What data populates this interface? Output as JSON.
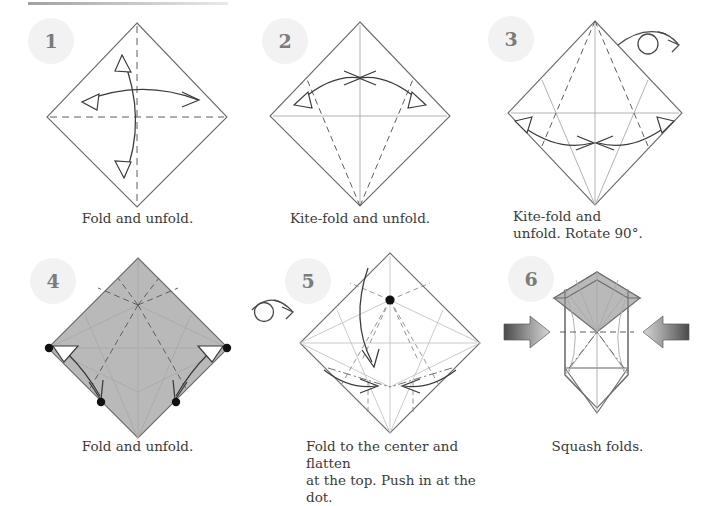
{
  "document": {
    "title": "Origami diagram sequence",
    "page_width": 703,
    "page_height": 494,
    "background_color": "#ffffff",
    "paper_front_color": "#b9b9b9",
    "paper_back_color": "#ffffff",
    "line_color": "#6d6d6d",
    "badge_color": "#f2f2f2",
    "badge_text_color": "#7b7b7b",
    "caption_color": "#3b3b3b"
  },
  "steps": [
    {
      "number": "1",
      "caption": "Fold and unfold.",
      "caption_align": "center",
      "shape": "diamond",
      "side_up": "white",
      "creases": [
        "horizontal-center-valley",
        "vertical-center-valley"
      ],
      "arrows": [
        "horizontal-double-headed",
        "vertical-double-headed"
      ],
      "rotate_symbol": false,
      "flip_symbol": false
    },
    {
      "number": "2",
      "caption": "Kite-fold and unfold.",
      "caption_align": "center",
      "shape": "diamond",
      "side_up": "white",
      "creases": [
        "horizontal-center",
        "vertical-center",
        "kite-left-valley",
        "kite-right-valley"
      ],
      "arrows": [
        "left-double-headed",
        "right-double-headed"
      ],
      "rotate_symbol": false,
      "flip_symbol": false
    },
    {
      "number": "3",
      "caption": "Kite-fold and\nunfold. Rotate 90°.",
      "caption_align": "left",
      "shape": "diamond",
      "side_up": "white",
      "creases": [
        "horizontal-center",
        "vertical-center",
        "kite-lower-left",
        "kite-lower-right",
        "kite-upper-left-valley",
        "kite-upper-right-valley"
      ],
      "arrows": [
        "left-double-headed",
        "right-double-headed"
      ],
      "rotate_symbol": false,
      "flip_symbol": true
    },
    {
      "number": "4",
      "caption": "Fold and unfold.",
      "caption_align": "center",
      "shape": "diamond",
      "side_up": "colored",
      "creases": [
        "horizontal-center",
        "vertical-center",
        "kite-all-four",
        "upper-fan-valleys",
        "lower-chevron"
      ],
      "arrows": [
        "left-down-curved",
        "right-down-curved"
      ],
      "dots": 4,
      "rotate_symbol": false,
      "flip_symbol": false
    },
    {
      "number": "5",
      "caption": "Fold to the center and flatten\nat the top. Push in at the dot.",
      "caption_align": "left",
      "shape": "diamond",
      "side_up": "white",
      "creases": [
        "horizontal-center",
        "vertical-center",
        "fan-from-dot",
        "lower-valleys",
        "upper-valleys"
      ],
      "arrows": [
        "down-into-center",
        "lower-left-inward",
        "lower-right-inward"
      ],
      "dots": 1,
      "rotate_symbol": false,
      "flip_symbol": true
    },
    {
      "number": "6",
      "caption": "Squash folds.",
      "caption_align": "center",
      "shape": "squash-preliminary",
      "side_up": "mixed",
      "creases": [
        "center-vertical",
        "horizontal-dash",
        "side-dash-dot"
      ],
      "arrows": [
        "push-left",
        "push-right"
      ],
      "rotate_symbol": false,
      "flip_symbol": false
    }
  ],
  "symbols": {
    "flip_over": "turn-over-arrow",
    "push": "push-arrow",
    "valley_fold": "dashed-line",
    "existing_crease": "thin-gray-line",
    "fold_arrow": "curved-arrow",
    "unfold_arrow": "hollow-arrowhead",
    "reference_point": "black-dot"
  }
}
